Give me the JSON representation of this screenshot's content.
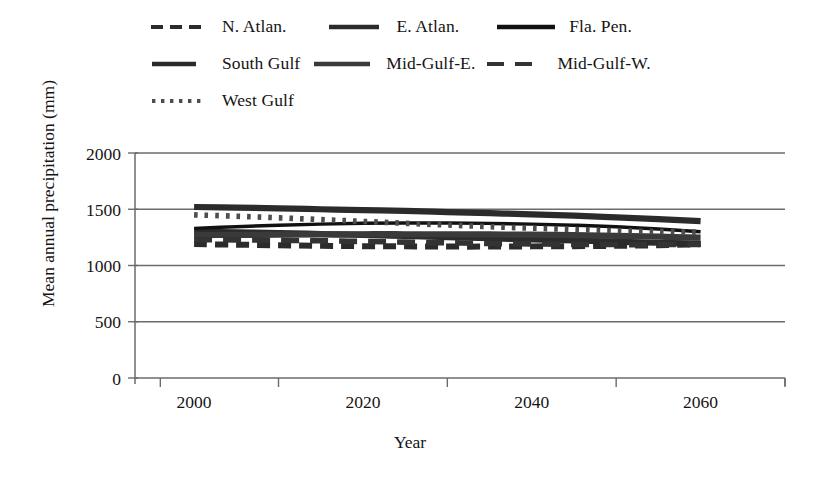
{
  "chart_data": {
    "type": "line",
    "title": "",
    "xlabel": "Year",
    "ylabel": "Mean annual precipitation (mm)",
    "xlim": [
      1993,
      2070
    ],
    "ylim": [
      0,
      2000
    ],
    "xticks": [
      2000,
      2020,
      2040,
      2060
    ],
    "yticks": [
      0,
      500,
      1000,
      1500,
      2000
    ],
    "grid": "horizontal",
    "legend_position": "top",
    "x": [
      2000,
      2005,
      2010,
      2015,
      2020,
      2025,
      2030,
      2035,
      2040,
      2045,
      2050,
      2055,
      2060
    ],
    "series": [
      {
        "name": "N. Atlan.",
        "style": "dashed",
        "color": "#2b2b2b",
        "values": [
          1190,
          1185,
          1180,
          1175,
          1172,
          1170,
          1168,
          1168,
          1170,
          1172,
          1175,
          1180,
          1190
        ]
      },
      {
        "name": "E. Atlan.",
        "style": "solid-thick",
        "color": "#2b2b2b",
        "values": [
          1300,
          1295,
          1288,
          1280,
          1272,
          1262,
          1252,
          1242,
          1232,
          1222,
          1212,
          1202,
          1195
        ]
      },
      {
        "name": "Fla. Pen.",
        "style": "solid",
        "color": "#111111",
        "values": [
          1330,
          1345,
          1358,
          1368,
          1375,
          1378,
          1378,
          1374,
          1368,
          1358,
          1345,
          1325,
          1300
        ]
      },
      {
        "name": "South Gulf",
        "style": "solid-thick",
        "color": "#2b2b2b",
        "values": [
          1520,
          1515,
          1508,
          1500,
          1492,
          1485,
          1475,
          1465,
          1455,
          1443,
          1428,
          1412,
          1395
        ]
      },
      {
        "name": "Mid-Gulf-E.",
        "style": "solid-thick",
        "color": "#3a3a3a",
        "values": [
          1270,
          1272,
          1274,
          1276,
          1278,
          1278,
          1278,
          1276,
          1274,
          1270,
          1264,
          1256,
          1248
        ]
      },
      {
        "name": "Mid-Gulf-W.",
        "style": "long-dash",
        "color": "#333333",
        "values": [
          1230,
          1228,
          1224,
          1220,
          1214,
          1208,
          1202,
          1196,
          1192,
          1188,
          1186,
          1186,
          1188
        ]
      },
      {
        "name": "West Gulf",
        "style": "dotted",
        "color": "#4d4d4d",
        "values": [
          1450,
          1438,
          1424,
          1408,
          1392,
          1375,
          1360,
          1345,
          1332,
          1320,
          1310,
          1302,
          1296
        ]
      }
    ]
  },
  "legend": {
    "rows": [
      [
        {
          "label": "N. Atlan.",
          "style": "dashed"
        },
        {
          "label": "E. Atlan.",
          "style": "solid-thick"
        },
        {
          "label": "Fla. Pen.",
          "style": "solid"
        }
      ],
      [
        {
          "label": "South Gulf",
          "style": "solid-thick"
        },
        {
          "label": "Mid-Gulf-E.",
          "style": "solid-thick"
        },
        {
          "label": "Mid-Gulf-W.",
          "style": "long-dash"
        }
      ],
      [
        {
          "label": "West Gulf",
          "style": "dotted"
        }
      ]
    ],
    "items": [
      {
        "label": "N. Atlan."
      },
      {
        "label": "E. Atlan."
      },
      {
        "label": "Fla. Pen."
      },
      {
        "label": "South Gulf"
      },
      {
        "label": "Mid-Gulf-E."
      },
      {
        "label": "Mid-Gulf-W."
      },
      {
        "label": "West Gulf"
      }
    ]
  },
  "axes": {
    "y_title": "Mean annual precipitation (mm)",
    "x_title": "Year",
    "y_ticks": [
      "2000",
      "1500",
      "1000",
      "500",
      "0"
    ],
    "x_ticks": [
      "2000",
      "2020",
      "2040",
      "2060"
    ]
  },
  "colors": {
    "axis": "#6b6b6b",
    "grid": "#6b6b6b",
    "text": "#141414",
    "background": "#ffffff"
  }
}
